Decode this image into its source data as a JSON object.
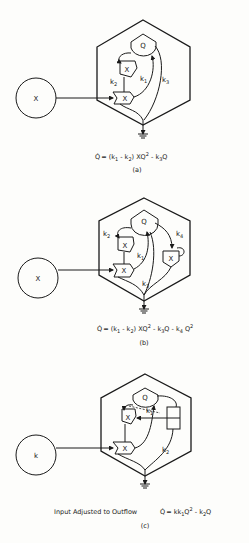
{
  "panels": [
    {
      "id": "a",
      "source_label": "X",
      "storage_label": "Q",
      "workgate_labels": [
        "X",
        "X"
      ],
      "rate_labels": {
        "k1": "k",
        "k1_sub": "1",
        "k2": "k",
        "k2_sub": "2",
        "k3": "k",
        "k3_sub": "3"
      },
      "equation": {
        "lhs": "Q̇",
        "parts": [
          "= (k",
          "1",
          " - k",
          "2",
          ") XQ",
          "2",
          " - k",
          "3",
          "Q"
        ]
      },
      "caption": "(a)"
    },
    {
      "id": "b",
      "source_label": "X",
      "storage_label": "Q",
      "workgate_labels": [
        "X",
        "X",
        "X"
      ],
      "rate_labels": {
        "k1": "k",
        "k1_sub": "1",
        "k2": "k",
        "k2_sub": "2",
        "k3": "k",
        "k3_sub": "3",
        "k4": "k",
        "k4_sub": "4"
      },
      "equation": {
        "lhs": "Q̇",
        "parts": [
          "= (k",
          "1",
          " - k",
          "2",
          ") XQ",
          "2",
          " - k",
          "3",
          "Q - k",
          "4",
          " Q",
          "2"
        ]
      },
      "caption": "(b)"
    },
    {
      "id": "c",
      "source_label": "k",
      "storage_label": "Q",
      "workgate_labels": [
        "X",
        "X"
      ],
      "rate_labels": {
        "k1": "k",
        "k1_sub": "1",
        "k2": "k",
        "k2_sub": "2"
      },
      "prefix_text": "Input Adjusted to Outflow",
      "equation": {
        "lhs": "Q̇",
        "parts": [
          "= kk",
          "1",
          "Q",
          "2",
          " - k",
          "2",
          "Q"
        ]
      },
      "caption": "(c)"
    }
  ]
}
